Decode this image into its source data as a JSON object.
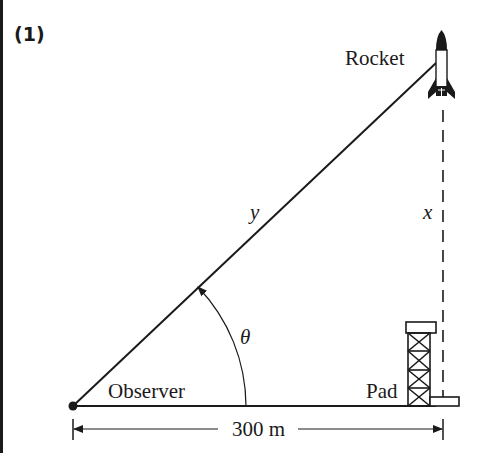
{
  "figure": {
    "number_label": "(1)",
    "labels": {
      "rocket": "Rocket",
      "observer": "Observer",
      "pad": "Pad",
      "distance": "300 m",
      "hypotenuse_var": "y",
      "height_var": "x",
      "angle_var": "θ"
    },
    "colors": {
      "ink": "#1a1a1a",
      "background": "#ffffff"
    },
    "geometry": {
      "observer_point": [
        73,
        406
      ],
      "rocket_point": [
        436,
        63
      ],
      "horizontal_distance_m": 300
    }
  }
}
